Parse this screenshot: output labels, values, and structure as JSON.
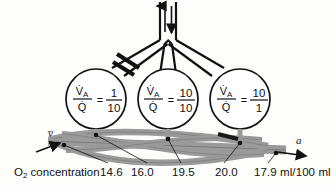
{
  "figure": {
    "airway": {
      "trachea_flow_icon": "bidirectional-airflow-arrows",
      "obstruction_icon": "bronchial-obstruction-bar",
      "obstruction_side": "left"
    },
    "alveoli": [
      {
        "id": "alveolus-left",
        "numerator_symbol": "V̇",
        "numerator_subscript": "A",
        "denominator_symbol": "Q̇",
        "equals": "=",
        "ratio_numerator": "1",
        "ratio_denominator": "10"
      },
      {
        "id": "alveolus-middle",
        "numerator_symbol": "V̇",
        "numerator_subscript": "A",
        "denominator_symbol": "Q̇",
        "equals": "=",
        "ratio_numerator": "10",
        "ratio_denominator": "10"
      },
      {
        "id": "alveolus-right",
        "numerator_symbol": "V̇",
        "numerator_subscript": "A",
        "denominator_symbol": "Q̇",
        "equals": "=",
        "ratio_numerator": "10",
        "ratio_denominator": "1"
      }
    ],
    "blood": {
      "venous_label": "v̅",
      "venous_label_name": "mixed-venous-blood-symbol",
      "arterial_label": "a",
      "arterial_label_name": "arterial-blood-symbol",
      "vessel_color": "#9a9a9a",
      "vessel_outline_color": "#555555"
    },
    "axis_label": {
      "prefix": "O",
      "subscript": "2",
      "suffix": " concentration"
    },
    "o2_values": [
      {
        "name": "o2-value-venous",
        "value": "14.6"
      },
      {
        "name": "o2-value-low-vq",
        "value": "16.0"
      },
      {
        "name": "o2-value-normal-vq",
        "value": "19.5"
      },
      {
        "name": "o2-value-high-vq",
        "value": "20.0"
      },
      {
        "name": "o2-value-arterial",
        "value": "17.9"
      }
    ],
    "units": "ml/100 ml",
    "colors": {
      "ink": "#111111",
      "vessel_fill": "#9a9a9a",
      "vessel_stroke": "#555555",
      "background": "#fdfdfc"
    }
  }
}
